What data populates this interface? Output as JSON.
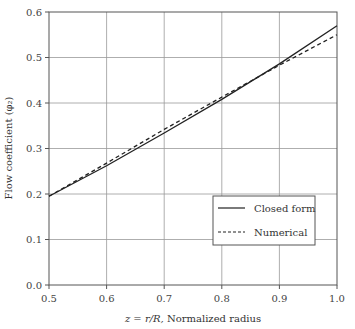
{
  "chart_data": {
    "type": "line",
    "title": "",
    "xlabel": "z = r/R, Normalized radius",
    "ylabel": "Flow coefficient (φ₂)",
    "xlim": [
      0.5,
      1.0
    ],
    "ylim": [
      0.0,
      0.6
    ],
    "x_ticks": [
      "0.5",
      "0.6",
      "0.7",
      "0.8",
      "0.9",
      "1.0"
    ],
    "y_ticks": [
      "0.0",
      "0.1",
      "0.2",
      "0.3",
      "0.4",
      "0.5",
      "0.6"
    ],
    "grid": true,
    "legend_position": "lower right",
    "x": [
      0.5,
      0.6,
      0.7,
      0.8,
      0.9,
      1.0
    ],
    "series": [
      {
        "name": "Closed form",
        "style": "solid",
        "values": [
          0.195,
          0.262,
          0.334,
          0.408,
          0.486,
          0.57
        ]
      },
      {
        "name": "Numerical",
        "style": "dashed",
        "values": [
          0.195,
          0.268,
          0.342,
          0.413,
          0.483,
          0.55
        ]
      }
    ]
  },
  "labels": {
    "xlabel_prefix": "z = r/R,",
    "xlabel_suffix": " Normalized radius",
    "ylabel": "Flow coefficient (φ₂)"
  },
  "legend": {
    "items": [
      {
        "label": "Closed form"
      },
      {
        "label": "Numerical"
      }
    ]
  }
}
